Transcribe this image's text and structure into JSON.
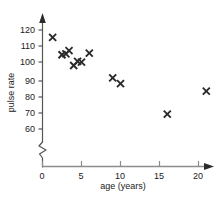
{
  "chart_data": {
    "type": "scatter",
    "title": "",
    "xlabel": "age (years)",
    "ylabel": "pulse rate",
    "xlim": [
      0,
      23
    ],
    "ylim": [
      55,
      125
    ],
    "y_axis_break": true,
    "grid": false,
    "legend": null,
    "marker": "x",
    "marker_color": "#2b2b2b",
    "axis_color": "#555555",
    "background": "#ffffff",
    "xticks": [
      0,
      5,
      10,
      15,
      20
    ],
    "xtick_labels": [
      "0",
      "5",
      "10",
      "15",
      "20"
    ],
    "yticks": [
      60,
      70,
      80,
      90,
      100,
      110,
      120
    ],
    "ytick_labels": [
      "60",
      "70",
      "80",
      "90",
      "100",
      "110",
      "120"
    ],
    "x": [
      1.3,
      2.5,
      3.0,
      3.4,
      4.0,
      4.5,
      5.0,
      6.0,
      9.0,
      10.0,
      16.0,
      21.0
    ],
    "y": [
      115.5,
      105.0,
      105.5,
      107.5,
      98.5,
      101.0,
      100.5,
      106.0,
      91.0,
      87.5,
      69.0,
      83.0
    ],
    "points": [
      {
        "age": 1.3,
        "pulse": 115.5
      },
      {
        "age": 2.5,
        "pulse": 105.0
      },
      {
        "age": 3.0,
        "pulse": 105.5
      },
      {
        "age": 3.4,
        "pulse": 107.5
      },
      {
        "age": 4.0,
        "pulse": 98.5
      },
      {
        "age": 4.5,
        "pulse": 101.0
      },
      {
        "age": 5.0,
        "pulse": 100.5
      },
      {
        "age": 6.0,
        "pulse": 106.0
      },
      {
        "age": 9.0,
        "pulse": 91.0
      },
      {
        "age": 10.0,
        "pulse": 87.5
      },
      {
        "age": 16.0,
        "pulse": 69.0
      },
      {
        "age": 21.0,
        "pulse": 83.0
      }
    ]
  },
  "axes": {
    "x_title": "age (years)",
    "y_title": "pulse rate"
  }
}
